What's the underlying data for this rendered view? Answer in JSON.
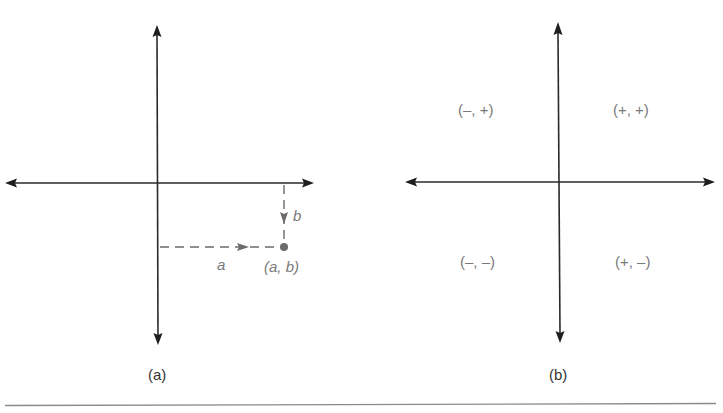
{
  "figure": {
    "panel_a": {
      "caption": "(a)",
      "point_label": "(a, b)",
      "horizontal_label": "a",
      "vertical_label": "b"
    },
    "panel_b": {
      "caption": "(b)",
      "quadrants": {
        "q1": "(+, +)",
        "q2": "(–, +)",
        "q3": "(–, –)",
        "q4": "(+, –)"
      }
    }
  },
  "colors": {
    "axis": "#2a2a2a",
    "label": "#7a7a7a",
    "dashed": "#6b6b6b",
    "rule": "#8a8a8a"
  }
}
